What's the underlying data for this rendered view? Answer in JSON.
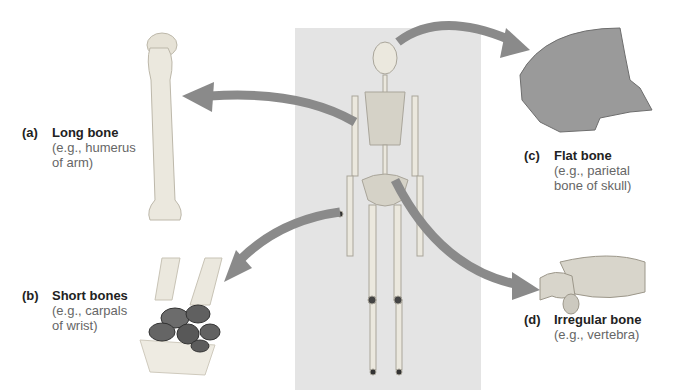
{
  "figure": {
    "center": "Human skeleton (anterior view)",
    "colors": {
      "panel": "#e4e4e4",
      "arrow": "#8a8a8a",
      "bone": "#e9e6dc",
      "dark_bone": "#5a5a5a",
      "text": "#222222",
      "example_text": "#666666"
    }
  },
  "labels": [
    {
      "tag": "(a)",
      "name": "Long bone",
      "example_line1": "(e.g., humerus",
      "example_line2": "of arm)"
    },
    {
      "tag": "(b)",
      "name": "Short bones",
      "example_line1": "(e.g., carpals",
      "example_line2": "of wrist)"
    },
    {
      "tag": "(c)",
      "name": "Flat bone",
      "example_line1": "(e.g., parietal",
      "example_line2": "bone of skull)"
    },
    {
      "tag": "(d)",
      "name": "Irregular bone",
      "example_line1": "(e.g., vertebra)",
      "example_line2": ""
    }
  ]
}
